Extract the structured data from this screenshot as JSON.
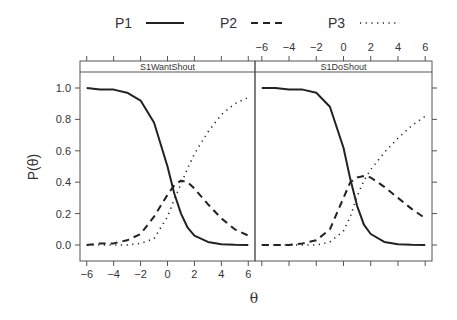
{
  "chart_data": {
    "type": "line",
    "title": "",
    "xlabel": "θ",
    "ylabel": "P(θ)",
    "xlim": [
      -6.5,
      6.5
    ],
    "ylim": [
      -0.08,
      1.08
    ],
    "x_ticks": [
      -6,
      -4,
      -2,
      0,
      2,
      4,
      6
    ],
    "x_tick_labels": [
      "−6",
      "−4",
      "−2",
      "0",
      "2",
      "4",
      "6"
    ],
    "y_ticks": [
      0.0,
      0.2,
      0.4,
      0.6,
      0.8,
      1.0
    ],
    "y_tick_labels": [
      "0.0",
      "0.2",
      "0.4",
      "0.6",
      "0.8",
      "1.0"
    ],
    "grid": false,
    "legend_position": "top",
    "legend": [
      {
        "name": "P1",
        "style": "solid"
      },
      {
        "name": "P2",
        "style": "dashed"
      },
      {
        "name": "P3",
        "style": "dotted"
      }
    ],
    "x": [
      -6,
      -5,
      -4,
      -3,
      -2,
      -1,
      0,
      0.5,
      1,
      1.5,
      2,
      3,
      4,
      5,
      6
    ],
    "panels": [
      {
        "strip": "S1WantShout",
        "series": [
          {
            "name": "P1",
            "values": [
              1.0,
              0.99,
              0.99,
              0.97,
              0.92,
              0.78,
              0.5,
              0.33,
              0.2,
              0.11,
              0.06,
              0.02,
              0.005,
              0.001,
              0.0
            ]
          },
          {
            "name": "P2",
            "values": [
              0.0,
              0.01,
              0.01,
              0.03,
              0.07,
              0.18,
              0.32,
              0.38,
              0.41,
              0.4,
              0.36,
              0.26,
              0.17,
              0.1,
              0.06
            ]
          },
          {
            "name": "P3",
            "values": [
              0.0,
              0.0,
              0.0,
              0.0,
              0.01,
              0.04,
              0.18,
              0.29,
              0.39,
              0.49,
              0.58,
              0.72,
              0.83,
              0.9,
              0.94
            ]
          }
        ]
      },
      {
        "strip": "S1DoShout",
        "series": [
          {
            "name": "P1",
            "values": [
              1.0,
              1.0,
              0.99,
              0.99,
              0.97,
              0.88,
              0.62,
              0.42,
              0.25,
              0.13,
              0.07,
              0.02,
              0.005,
              0.001,
              0.0
            ]
          },
          {
            "name": "P2",
            "values": [
              0.0,
              0.0,
              0.0,
              0.01,
              0.03,
              0.1,
              0.3,
              0.4,
              0.43,
              0.44,
              0.43,
              0.37,
              0.3,
              0.23,
              0.17
            ]
          },
          {
            "name": "P3",
            "values": [
              0.0,
              0.0,
              0.0,
              0.0,
              0.0,
              0.02,
              0.09,
              0.18,
              0.31,
              0.41,
              0.48,
              0.59,
              0.68,
              0.76,
              0.82
            ]
          }
        ]
      }
    ]
  }
}
